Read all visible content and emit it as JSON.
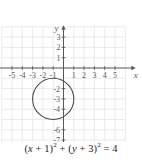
{
  "figure": {
    "caption_parts": {
      "open1": "(",
      "x": "x",
      "plus1": " + ",
      "one": "1",
      "close1": ")",
      "sq1": "2",
      "plus_mid": " + ",
      "open2": "(",
      "y": "y",
      "plus2": " + ",
      "three": "3",
      "close2": ")",
      "sq2": "2",
      "equals": " = ",
      "four": "4"
    },
    "caption_text": "(x + 1)2 + (y + 3)2 = 4"
  },
  "chart_data": {
    "type": "scatter",
    "title": "",
    "subtitle": "",
    "xlabel": "x",
    "ylabel": "y",
    "xlim": [
      -6,
      6
    ],
    "ylim": [
      -8,
      4
    ],
    "grid": true,
    "grid_color": "#e8e8ea",
    "axis_color": "#58585a",
    "curve_color": "#4b4b4d",
    "legend": "none",
    "xticks": [
      -5,
      -4,
      -3,
      -2,
      -1,
      1,
      2,
      3,
      4,
      5
    ],
    "xtick_labels": [
      "-5",
      "-4",
      "-3",
      "-2",
      "-1",
      "1",
      "2",
      "3",
      "4",
      "5"
    ],
    "yticks": [
      3,
      2,
      1,
      -2,
      -3,
      -4,
      -6,
      -7
    ],
    "ytick_labels": [
      "3",
      "2",
      "1",
      "-2",
      "-3",
      "-4",
      "-6",
      "-7"
    ],
    "series": [
      {
        "name": "circle",
        "kind": "circle",
        "equation": "(x + 1)^2 + (y + 3)^2 = 4",
        "center": [
          -1,
          -3
        ],
        "radius": 2,
        "stroke_width": 1.1
      }
    ],
    "annotations": []
  }
}
